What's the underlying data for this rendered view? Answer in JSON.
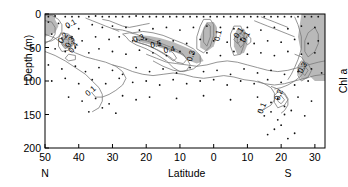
{
  "chart_data": {
    "type": "contour",
    "title": "",
    "xlabel": "Latitude",
    "ylabel": "Depth (m)",
    "side_label": "Chl a",
    "hemisphere_left": "N",
    "hemisphere_right": "S",
    "xticks": [
      "50",
      "40",
      "30",
      "20",
      "10",
      "0",
      "10",
      "20",
      "30"
    ],
    "xtick_values": [
      50,
      40,
      30,
      20,
      10,
      0,
      -10,
      -20,
      -30
    ],
    "xlim": [
      50,
      -33
    ],
    "yticks": [
      "0",
      "50",
      "100",
      "150",
      "200"
    ],
    "ytick_values": [
      0,
      50,
      100,
      150,
      200
    ],
    "ylim": [
      0,
      200
    ],
    "y_inverted": true,
    "grid": false,
    "legend": "none",
    "contour_levels": [
      0.1,
      0.2,
      0.3,
      0.4,
      0.5
    ],
    "shaded_threshold": 0.3,
    "shade_color": "#b9b9b9",
    "contour_color": "#7a7a7a",
    "marker_color": "#111111",
    "units": "mg m-3",
    "contour_labels": [
      {
        "text": "0.1",
        "lat": 42,
        "depth": 18,
        "rotation": -30
      },
      {
        "text": "0.2",
        "lat": 44,
        "depth": 38,
        "rotation": -55
      },
      {
        "text": "0.3",
        "lat": 42,
        "depth": 44,
        "rotation": -60
      },
      {
        "text": "0.4",
        "lat": 41,
        "depth": 52,
        "rotation": -55
      },
      {
        "text": "0.3",
        "lat": 22,
        "depth": 40,
        "rotation": -20
      },
      {
        "text": "0.5",
        "lat": 17,
        "depth": 49,
        "rotation": -12
      },
      {
        "text": "0.4",
        "lat": 13,
        "depth": 57,
        "rotation": -12
      },
      {
        "text": "0.3",
        "lat": 6,
        "depth": 64,
        "rotation": -70
      },
      {
        "text": "0.1",
        "lat": -2,
        "depth": 33,
        "rotation": -78
      },
      {
        "text": "0.1",
        "lat": -8,
        "depth": 30,
        "rotation": -55
      },
      {
        "text": "0.1",
        "lat": -10,
        "depth": 36,
        "rotation": -60
      },
      {
        "text": "0.3",
        "lat": -27,
        "depth": 82,
        "rotation": -60
      },
      {
        "text": "0.2",
        "lat": -20,
        "depth": 122,
        "rotation": -70
      },
      {
        "text": "0.1",
        "lat": -15,
        "depth": 142,
        "rotation": -68
      },
      {
        "text": "0.1",
        "lat": 36,
        "depth": 118,
        "rotation": -40
      }
    ],
    "sample_points": [
      [
        49,
        4
      ],
      [
        47,
        3
      ],
      [
        44,
        4
      ],
      [
        42,
        4
      ],
      [
        40,
        4
      ],
      [
        37,
        4
      ],
      [
        35,
        3
      ],
      [
        33,
        4
      ],
      [
        31,
        4
      ],
      [
        29,
        4
      ],
      [
        27,
        4
      ],
      [
        25,
        4
      ],
      [
        23,
        3
      ],
      [
        21,
        4
      ],
      [
        19,
        4
      ],
      [
        17,
        4
      ],
      [
        15,
        4
      ],
      [
        13,
        4
      ],
      [
        11,
        4
      ],
      [
        9,
        4
      ],
      [
        7,
        4
      ],
      [
        5,
        4
      ],
      [
        3,
        4
      ],
      [
        1,
        4
      ],
      [
        -1,
        4
      ],
      [
        -3,
        4
      ],
      [
        -5,
        4
      ],
      [
        -7,
        4
      ],
      [
        -9,
        4
      ],
      [
        -11,
        4
      ],
      [
        -13,
        4
      ],
      [
        -15,
        4
      ],
      [
        -17,
        4
      ],
      [
        -19,
        4
      ],
      [
        -21,
        4
      ],
      [
        -23,
        4
      ],
      [
        -25,
        4
      ],
      [
        -27,
        4
      ],
      [
        -29,
        4
      ],
      [
        -31,
        4
      ],
      [
        49,
        12
      ],
      [
        46,
        14
      ],
      [
        43,
        20
      ],
      [
        40,
        22
      ],
      [
        36,
        16
      ],
      [
        33,
        20
      ],
      [
        30,
        18
      ],
      [
        26,
        20
      ],
      [
        22,
        24
      ],
      [
        18,
        22
      ],
      [
        14,
        20
      ],
      [
        10,
        24
      ],
      [
        6,
        20
      ],
      [
        2,
        18
      ],
      [
        -2,
        20
      ],
      [
        -6,
        22
      ],
      [
        -10,
        20
      ],
      [
        -14,
        24
      ],
      [
        -18,
        20
      ],
      [
        -22,
        22
      ],
      [
        -26,
        18
      ],
      [
        -30,
        20
      ],
      [
        48,
        30
      ],
      [
        45,
        36
      ],
      [
        42,
        34
      ],
      [
        39,
        40
      ],
      [
        35,
        34
      ],
      [
        31,
        38
      ],
      [
        28,
        34
      ],
      [
        24,
        40
      ],
      [
        20,
        38
      ],
      [
        16,
        44
      ],
      [
        12,
        40
      ],
      [
        8,
        44
      ],
      [
        4,
        38
      ],
      [
        0,
        40
      ],
      [
        -4,
        42
      ],
      [
        -8,
        38
      ],
      [
        -12,
        44
      ],
      [
        -16,
        40
      ],
      [
        -20,
        42
      ],
      [
        -24,
        38
      ],
      [
        -28,
        44
      ],
      [
        -31,
        40
      ],
      [
        47,
        52
      ],
      [
        44,
        56
      ],
      [
        41,
        50
      ],
      [
        37,
        58
      ],
      [
        34,
        52
      ],
      [
        30,
        56
      ],
      [
        26,
        60
      ],
      [
        22,
        54
      ],
      [
        18,
        58
      ],
      [
        14,
        62
      ],
      [
        10,
        56
      ],
      [
        6,
        60
      ],
      [
        2,
        58
      ],
      [
        -2,
        62
      ],
      [
        -6,
        56
      ],
      [
        -10,
        60
      ],
      [
        -14,
        58
      ],
      [
        -18,
        62
      ],
      [
        -22,
        56
      ],
      [
        -26,
        60
      ],
      [
        -30,
        58
      ],
      [
        49,
        76
      ],
      [
        45,
        82
      ],
      [
        41,
        78
      ],
      [
        38,
        86
      ],
      [
        34,
        80
      ],
      [
        30,
        84
      ],
      [
        27,
        90
      ],
      [
        23,
        80
      ],
      [
        19,
        86
      ],
      [
        15,
        82
      ],
      [
        11,
        88
      ],
      [
        7,
        80
      ],
      [
        3,
        86
      ],
      [
        -1,
        84
      ],
      [
        -5,
        90
      ],
      [
        -9,
        82
      ],
      [
        -13,
        88
      ],
      [
        -17,
        84
      ],
      [
        -21,
        90
      ],
      [
        -25,
        86
      ],
      [
        -29,
        82
      ],
      [
        -32,
        88
      ],
      [
        48,
        100
      ],
      [
        44,
        96
      ],
      [
        40,
        104
      ],
      [
        36,
        98
      ],
      [
        32,
        104
      ],
      [
        28,
        96
      ],
      [
        24,
        102
      ],
      [
        20,
        100
      ],
      [
        16,
        106
      ],
      [
        12,
        98
      ],
      [
        8,
        104
      ],
      [
        4,
        100
      ],
      [
        0,
        98
      ],
      [
        -4,
        106
      ],
      [
        -8,
        100
      ],
      [
        -12,
        104
      ],
      [
        -16,
        98
      ],
      [
        -20,
        102
      ],
      [
        -24,
        106
      ],
      [
        -28,
        100
      ],
      [
        43,
        124
      ],
      [
        39,
        130
      ],
      [
        35,
        126
      ],
      [
        31,
        134
      ],
      [
        27,
        122
      ],
      [
        23,
        128
      ],
      [
        19,
        124
      ],
      [
        11,
        126
      ],
      [
        3,
        122
      ],
      [
        -5,
        128
      ],
      [
        -13,
        124
      ],
      [
        -17,
        132
      ],
      [
        -19,
        126
      ],
      [
        -21,
        138
      ],
      [
        -25,
        124
      ],
      [
        -29,
        130
      ],
      [
        37,
        146
      ],
      [
        33,
        140
      ],
      [
        29,
        148
      ],
      [
        -15,
        152
      ],
      [
        -17,
        146
      ],
      [
        -19,
        158
      ],
      [
        -21,
        150
      ],
      [
        -23,
        144
      ],
      [
        -27,
        152
      ],
      [
        -18,
        172
      ],
      [
        -20,
        166
      ],
      [
        -16,
        180
      ],
      [
        -22,
        186
      ],
      [
        -24,
        178
      ]
    ]
  }
}
